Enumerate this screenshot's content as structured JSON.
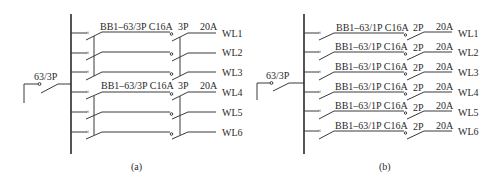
{
  "diagrams": [
    {
      "id": "a",
      "caption": "(a)",
      "main_breaker": "63/3P",
      "groups": [
        {
          "breaker": "BB1–63/3P C16A",
          "rcd_poles": "3P",
          "rcd_rating": "20A"
        },
        {
          "breaker": "BB1–63/3P C16A",
          "rcd_poles": "3P",
          "rcd_rating": "20A"
        }
      ],
      "circuits": [
        "WL1",
        "WL2",
        "WL3",
        "WL4",
        "WL5",
        "WL6"
      ]
    },
    {
      "id": "b",
      "caption": "(b)",
      "main_breaker": "63/3P",
      "branches": [
        {
          "breaker": "BB1–63/1P C16A",
          "rcd_poles": "2P",
          "rcd_rating": "20A",
          "circuit": "WL1"
        },
        {
          "breaker": "BB1–63/1P C16A",
          "rcd_poles": "2P",
          "rcd_rating": "20A",
          "circuit": "WL2"
        },
        {
          "breaker": "BB1–63/1P C16A",
          "rcd_poles": "2P",
          "rcd_rating": "20A",
          "circuit": "WL3"
        },
        {
          "breaker": "BB1–63/1P C16A",
          "rcd_poles": "2P",
          "rcd_rating": "20A",
          "circuit": "WL4"
        },
        {
          "breaker": "BB1–63/1P C16A",
          "rcd_poles": "2P",
          "rcd_rating": "20A",
          "circuit": "WL5"
        },
        {
          "breaker": "BB1–63/1P C16A",
          "rcd_poles": "2P",
          "rcd_rating": "20A",
          "circuit": "WL6"
        }
      ]
    }
  ]
}
